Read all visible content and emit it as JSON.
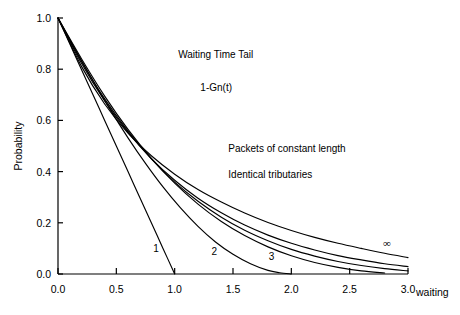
{
  "chart_data": {
    "type": "line",
    "title": "Waiting Time Tail",
    "subtitle": "1-Gn(t)",
    "xlabel": "waiting",
    "ylabel": "Probability",
    "xlim": [
      0.0,
      3.0
    ],
    "ylim": [
      0.0,
      1.0
    ],
    "grid": false,
    "legend_position": "inline-curve-labels",
    "xticks": [
      "0.0",
      "0.5",
      "1.0",
      "1.5",
      "2.0",
      "2.5",
      "3.0"
    ],
    "xtick_values": [
      0.0,
      0.5,
      1.0,
      1.5,
      2.0,
      2.5,
      3.0
    ],
    "yticks": [
      "0.0",
      "0.2",
      "0.4",
      "0.6",
      "0.8",
      "1.0"
    ],
    "ytick_values": [
      0.0,
      0.2,
      0.4,
      0.6,
      0.8,
      1.0
    ],
    "annotations": [
      {
        "text": "Waiting Time Tail",
        "x": 1.03,
        "y": 0.845
      },
      {
        "text": "1-Gn(t)",
        "x": 1.22,
        "y": 0.715
      },
      {
        "text": "Packets of constant length",
        "x": 1.46,
        "y": 0.475
      },
      {
        "text": "Identical tributaries",
        "x": 1.46,
        "y": 0.375
      }
    ],
    "curve_labels": [
      {
        "text": "1",
        "x": 0.84,
        "y": 0.085
      },
      {
        "text": "2",
        "x": 1.34,
        "y": 0.075
      },
      {
        "text": "3",
        "x": 1.83,
        "y": 0.055
      },
      {
        "text": "∞",
        "x": 2.82,
        "y": 0.105
      }
    ],
    "series": [
      {
        "name": "1",
        "label": "1",
        "x": [
          0.0,
          0.1,
          0.2,
          0.3,
          0.4,
          0.5,
          0.6,
          0.7,
          0.8,
          0.9,
          1.0
        ],
        "values": [
          1.0,
          0.9,
          0.8,
          0.7,
          0.6,
          0.5,
          0.4,
          0.3,
          0.2,
          0.1,
          0.0
        ]
      },
      {
        "name": "2",
        "label": "2",
        "x": [
          0.0,
          0.15,
          0.3,
          0.45,
          0.6,
          0.75,
          0.9,
          1.05,
          1.2,
          1.35,
          1.5,
          1.65,
          1.8,
          1.9,
          2.0
        ],
        "values": [
          1.0,
          0.875,
          0.755,
          0.64,
          0.532,
          0.432,
          0.34,
          0.258,
          0.186,
          0.125,
          0.077,
          0.04,
          0.014,
          0.005,
          0.0
        ]
      },
      {
        "name": "3",
        "label": "3",
        "x": [
          0.0,
          0.2,
          0.4,
          0.6,
          0.8,
          1.0,
          1.2,
          1.4,
          1.6,
          1.8,
          2.0,
          2.2,
          2.4,
          2.6,
          2.8
        ],
        "values": [
          1.0,
          0.842,
          0.695,
          0.565,
          0.452,
          0.355,
          0.273,
          0.205,
          0.15,
          0.106,
          0.071,
          0.045,
          0.026,
          0.012,
          0.004
        ]
      },
      {
        "name": "4",
        "label": "",
        "x": [
          0.0,
          0.2,
          0.4,
          0.6,
          0.8,
          1.0,
          1.2,
          1.4,
          1.6,
          1.8,
          2.0,
          2.2,
          2.4,
          2.6,
          2.8,
          3.0
        ],
        "values": [
          1.0,
          0.832,
          0.684,
          0.558,
          0.45,
          0.359,
          0.284,
          0.222,
          0.171,
          0.13,
          0.096,
          0.07,
          0.049,
          0.033,
          0.021,
          0.012
        ]
      },
      {
        "name": "6",
        "label": "",
        "x": [
          0.0,
          0.2,
          0.4,
          0.6,
          0.8,
          1.0,
          1.2,
          1.4,
          1.6,
          1.8,
          2.0,
          2.2,
          2.4,
          2.6,
          2.8,
          3.0
        ],
        "values": [
          1.0,
          0.824,
          0.676,
          0.553,
          0.451,
          0.366,
          0.296,
          0.239,
          0.191,
          0.152,
          0.12,
          0.094,
          0.072,
          0.055,
          0.04,
          0.029
        ]
      },
      {
        "name": "infinity",
        "label": "∞",
        "x": [
          0.0,
          0.2,
          0.4,
          0.6,
          0.8,
          1.0,
          1.2,
          1.4,
          1.6,
          1.8,
          2.0,
          2.2,
          2.4,
          2.6,
          2.8,
          3.0
        ],
        "values": [
          1.0,
          0.812,
          0.664,
          0.55,
          0.462,
          0.39,
          0.33,
          0.281,
          0.238,
          0.201,
          0.17,
          0.143,
          0.12,
          0.1,
          0.081,
          0.064
        ]
      }
    ]
  }
}
